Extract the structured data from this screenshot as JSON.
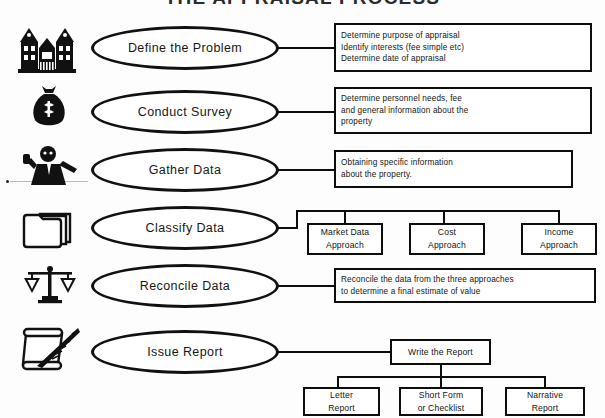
{
  "document": {
    "title": "THE APPRAISAL PROCESS"
  },
  "steps": [
    {
      "icon": "mansion-icon",
      "stage": "Define the Problem",
      "detail": "Determine purpose of appraisal\nIdentify interests (fee simple etc)\nDetermine date of appraisal"
    },
    {
      "icon": "money-bag-icon",
      "stage": "Conduct Survey",
      "detail": "Determine personnel needs, fee\nand general information about the\nproperty"
    },
    {
      "icon": "person-on-phone-icon",
      "stage": "Gather Data",
      "detail": "Obtaining specific information\nabout the property."
    },
    {
      "icon": "folders-icon",
      "stage": "Classify Data",
      "detail": ""
    },
    {
      "icon": "balance-scales-icon",
      "stage": "Reconcile Data",
      "detail": "Reconcile the data from the three approaches\nto determine a final estimate of value"
    },
    {
      "icon": "scroll-quill-icon",
      "stage": "Issue Report",
      "detail": ""
    }
  ],
  "approaches": [
    {
      "label": "Market Data\nApproach"
    },
    {
      "label": "Cost\nApproach"
    },
    {
      "label": "Income\nApproach"
    }
  ],
  "report": {
    "parent": "Write the Report",
    "types": [
      {
        "label": "Letter\nReport"
      },
      {
        "label": "Short Form\nor Checklist"
      },
      {
        "label": "Narrative\nReport"
      }
    ]
  },
  "colors": {
    "stroke": "#0d0d0d",
    "background": "#fdfdfd",
    "text": "#131313"
  }
}
